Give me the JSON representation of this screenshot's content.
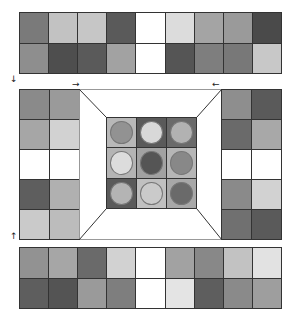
{
  "top_strip": {
    "rows": [
      [
        "#7a7a7a",
        "#c2c2c2",
        "#c6c6c6",
        "#5a5a5a",
        "#ffffff",
        "#dcdcdc",
        "#a4a4a4",
        "#9a9a9a",
        "#4a4a4a"
      ],
      [
        "#8e8e8e",
        "#4e4e4e",
        "#5a5a5a",
        "#a2a2a2",
        "#ffffff",
        "#555555",
        "#7e7e7e",
        "#787878",
        "#c8c8c8"
      ]
    ]
  },
  "left_column": {
    "rows": [
      [
        "#8a8a8a",
        "#9a9a9a"
      ],
      [
        "#a6a6a6",
        "#d2d2d2"
      ],
      [
        "#ffffff",
        "#ffffff"
      ],
      [
        "#5e5e5e",
        "#b0b0b0"
      ],
      [
        "#cacaca",
        "#bcbcbc"
      ]
    ]
  },
  "right_column": {
    "rows": [
      [
        "#8e8e8e",
        "#5a5a5a"
      ],
      [
        "#6a6a6a",
        "#a8a8a8"
      ],
      [
        "#ffffff",
        "#ffffff"
      ],
      [
        "#8a8a8a",
        "#d2d2d2"
      ],
      [
        "#707070",
        "#5a5a5a"
      ]
    ]
  },
  "center_grid": {
    "cells": [
      {
        "bg": "#b8b8b8",
        "disc": "#929292"
      },
      {
        "bg": "#5a5a5a",
        "disc": "#d8d8d8"
      },
      {
        "bg": "#6a6a6a",
        "disc": "#b2b2b2"
      },
      {
        "bg": "#b4b4b4",
        "disc": "#dcdcdc"
      },
      {
        "bg": "#a2a2a2",
        "disc": "#555555"
      },
      {
        "bg": "#b6b6b6",
        "disc": "#888888"
      },
      {
        "bg": "#5a5a5a",
        "disc": "#b4b4b4"
      },
      {
        "bg": "#c0c0c0",
        "disc": "#cacaca"
      },
      {
        "bg": "#a8a8a8",
        "disc": "#6a6a6a"
      }
    ]
  },
  "bottom_strip": {
    "rows": [
      [
        "#929292",
        "#a6a6a6",
        "#6a6a6a",
        "#d2d2d2",
        "#ffffff",
        "#a2a2a2",
        "#888888",
        "#c2c2c2",
        "#e2e2e2"
      ],
      [
        "#5e5e5e",
        "#545454",
        "#9a9a9a",
        "#7e7e7e",
        "#ffffff",
        "#e4e4e4",
        "#5e5e5e",
        "#8a8a8a",
        "#9e9e9e"
      ]
    ]
  },
  "arrows": {
    "down_left": "↓",
    "up_left": "↑",
    "right_top": "→",
    "left_top": "←"
  }
}
